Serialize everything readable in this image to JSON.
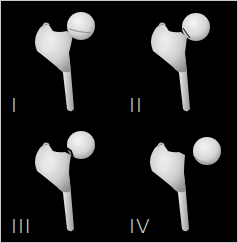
{
  "figure": {
    "background_color": "#000000",
    "bone_color": "#d4d4d4",
    "label_color": "#e6e6e6",
    "panels": [
      {
        "label": "I"
      },
      {
        "label": "II"
      },
      {
        "label": "III"
      },
      {
        "label": "IV"
      }
    ]
  }
}
